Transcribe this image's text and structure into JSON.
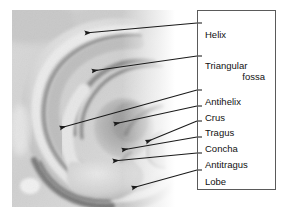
{
  "figure": {
    "type": "labelled-anatomical-diagram",
    "width": 284,
    "height": 215,
    "background_color": "#ffffff",
    "line_color": "#1a1a1a",
    "text_color": "#111111",
    "box_border_color": "#5a5a5a"
  },
  "photo": {
    "name": "ear-photograph",
    "description": "Grayscale close-up photograph of a human outer ear",
    "x": 12,
    "y": 10,
    "width": 163,
    "height": 197
  },
  "label_box": {
    "x": 197,
    "y": 10,
    "width": 79,
    "height": 180
  },
  "labels": [
    {
      "id": "helix",
      "text": "Helix",
      "label_x": 8,
      "label_y": 19,
      "align": "left",
      "line_start_x": 197,
      "line_start_y": 23,
      "arrow_tip_x": 85,
      "arrow_tip_y": 33
    },
    {
      "id": "triangular-fossa",
      "text": "Triangular",
      "text2": "fossa",
      "label_x": 8,
      "label_y": 50,
      "label2_y": 61,
      "align": "left",
      "line_start_x": 197,
      "line_start_y": 56,
      "arrow_tip_x": 92,
      "arrow_tip_y": 71
    },
    {
      "id": "antihelix",
      "text": "Antihelix",
      "label_x": 8,
      "label_y": 86,
      "align": "left",
      "line_start_x": 197,
      "line_start_y": 90,
      "arrow_tip_x": 60,
      "arrow_tip_y": 128
    },
    {
      "id": "crus",
      "text": "Crus",
      "label_x": 8,
      "label_y": 102,
      "align": "left",
      "line_start_x": 197,
      "line_start_y": 106,
      "arrow_tip_x": 114,
      "arrow_tip_y": 124
    },
    {
      "id": "tragus",
      "text": "Tragus",
      "label_x": 8,
      "label_y": 117,
      "align": "left",
      "line_start_x": 197,
      "line_start_y": 121,
      "arrow_tip_x": 146,
      "arrow_tip_y": 142
    },
    {
      "id": "concha",
      "text": "Concha",
      "label_x": 8,
      "label_y": 133,
      "align": "left",
      "line_start_x": 197,
      "line_start_y": 137,
      "arrow_tip_x": 122,
      "arrow_tip_y": 150
    },
    {
      "id": "antitragus",
      "text": "Antitragus",
      "label_x": 8,
      "label_y": 149,
      "align": "left",
      "line_start_x": 197,
      "line_start_y": 153,
      "arrow_tip_x": 113,
      "arrow_tip_y": 161
    },
    {
      "id": "lobe",
      "text": "Lobe",
      "label_x": 8,
      "label_y": 166,
      "align": "left",
      "line_start_x": 197,
      "line_start_y": 170,
      "arrow_tip_x": 132,
      "arrow_tip_y": 188
    }
  ]
}
